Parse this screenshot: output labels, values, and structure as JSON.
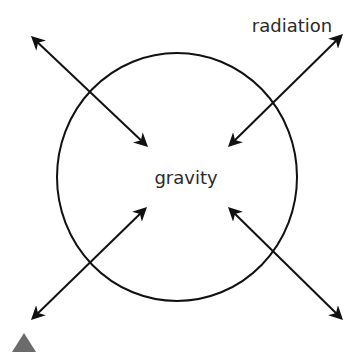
{
  "diagram": {
    "labels": {
      "center": "gravity",
      "corner": "radiation"
    },
    "colors": {
      "stroke": "#111111",
      "text": "#2a2a2a",
      "triangle": "#6b6b6b",
      "background": "#ffffff"
    },
    "arrows": [
      {
        "name": "arrow-top-left",
        "direction": "bidirectional"
      },
      {
        "name": "arrow-top-right",
        "direction": "bidirectional"
      },
      {
        "name": "arrow-bottom-left",
        "direction": "bidirectional"
      },
      {
        "name": "arrow-bottom-right",
        "direction": "bidirectional"
      }
    ]
  }
}
